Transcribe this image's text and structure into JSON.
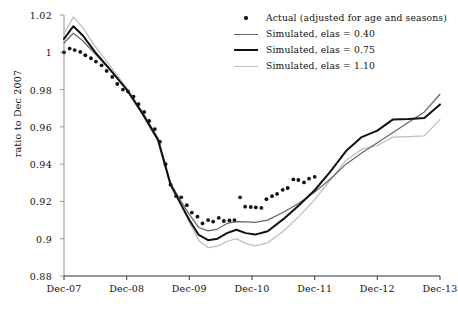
{
  "chart_data": {
    "type": "line",
    "title": "",
    "xlabel": "",
    "ylabel": "ratio to Dec 2007",
    "ylim": [
      0.88,
      1.02
    ],
    "xlim": [
      2007.0,
      2013.0
    ],
    "grid": false,
    "legend_position": "top-right",
    "ytick_labels": [
      "1.02",
      "1",
      "0.98",
      "0.96",
      "0.94",
      "0.92",
      "0.9",
      "0.88"
    ],
    "ytick_values": [
      1.02,
      1.0,
      0.98,
      0.96,
      0.94,
      0.92,
      0.9,
      0.88
    ],
    "xtick_labels": [
      "Dec-07",
      "Dec-08",
      "Dec-09",
      "Dec-10",
      "Dec-11",
      "Dec-12",
      "Dec-13"
    ],
    "xtick_values": [
      2007.0,
      2008.0,
      2009.0,
      2010.0,
      2011.0,
      2012.0,
      2013.0
    ],
    "colors": {
      "actual": "#111111",
      "elas_040": "#666666",
      "elas_075": "#111111",
      "elas_110": "#bdbdbd",
      "axis": "#999999",
      "background": "#ffffff"
    },
    "series": [
      {
        "name": "Actual (adjusted for age and seasons)",
        "type": "scatter",
        "color": "#111111",
        "x": [
          2007.0,
          2007.09,
          2007.17,
          2007.26,
          2007.34,
          2007.43,
          2007.51,
          2007.6,
          2007.68,
          2007.77,
          2007.85,
          2007.94,
          2008.02,
          2008.11,
          2008.19,
          2008.28,
          2008.36,
          2008.45,
          2008.53,
          2008.62,
          2008.7,
          2008.79,
          2008.87,
          2008.96,
          2009.04,
          2009.13,
          2009.21,
          2009.3,
          2009.38,
          2009.47,
          2009.55,
          2009.64,
          2009.72,
          2009.81,
          2009.89,
          2009.98,
          2010.06,
          2010.15,
          2010.23,
          2010.32,
          2010.4,
          2010.49,
          2010.57,
          2010.66,
          2010.74,
          2010.83,
          2010.91,
          2011.0
        ],
        "y": [
          1.0,
          1.002,
          1.0012,
          1.0002,
          0.9984,
          0.9968,
          0.995,
          0.993,
          0.99,
          0.9868,
          0.983,
          0.98,
          0.979,
          0.9762,
          0.9722,
          0.968,
          0.9632,
          0.9588,
          0.952,
          0.94,
          0.929,
          0.9228,
          0.9222,
          0.918,
          0.914,
          0.9118,
          0.9082,
          0.91,
          0.9092,
          0.9112,
          0.9095,
          0.9098,
          0.91,
          0.9222,
          0.9172,
          0.917,
          0.9168,
          0.9165,
          0.9212,
          0.9228,
          0.924,
          0.9262,
          0.9272,
          0.9318,
          0.9315,
          0.9302,
          0.9322,
          0.9332
        ]
      },
      {
        "name": "Simulated, elas = 0.40",
        "type": "line",
        "color": "#666666",
        "x": [
          2007.0,
          2007.15,
          2007.3,
          2007.5,
          2007.75,
          2008.0,
          2008.25,
          2008.5,
          2008.7,
          2008.85,
          2009.0,
          2009.15,
          2009.3,
          2009.45,
          2009.6,
          2009.75,
          2009.9,
          2010.05,
          2010.25,
          2010.5,
          2010.75,
          2011.0,
          2011.25,
          2011.5,
          2011.75,
          2012.0,
          2012.25,
          2012.5,
          2012.75,
          2013.0
        ],
        "y": [
          1.005,
          1.0102,
          1.0062,
          0.999,
          0.99,
          0.98,
          0.968,
          0.954,
          0.93,
          0.921,
          0.913,
          0.906,
          0.9042,
          0.9052,
          0.9082,
          0.9092,
          0.909,
          0.9088,
          0.91,
          0.9142,
          0.919,
          0.925,
          0.932,
          0.94,
          0.946,
          0.9515,
          0.957,
          0.9625,
          0.968,
          0.9775
        ]
      },
      {
        "name": "Simulated, elas = 0.75",
        "type": "line",
        "color": "#111111",
        "x": [
          2007.0,
          2007.15,
          2007.3,
          2007.5,
          2007.75,
          2008.0,
          2008.25,
          2008.5,
          2008.7,
          2008.85,
          2009.0,
          2009.15,
          2009.3,
          2009.45,
          2009.6,
          2009.75,
          2009.9,
          2010.05,
          2010.25,
          2010.5,
          2010.75,
          2011.0,
          2011.25,
          2011.5,
          2011.75,
          2012.0,
          2012.25,
          2012.5,
          2012.75,
          2013.0
        ],
        "y": [
          1.0072,
          1.014,
          1.009,
          1.0,
          0.9902,
          0.98,
          0.9672,
          0.953,
          0.929,
          0.9195,
          0.91,
          0.902,
          0.8992,
          0.9,
          0.903,
          0.9048,
          0.903,
          0.9022,
          0.904,
          0.9105,
          0.918,
          0.926,
          0.936,
          0.947,
          0.9545,
          0.958,
          0.964,
          0.9642,
          0.9648,
          0.972
        ]
      },
      {
        "name": "Simulated, elas = 1.10",
        "type": "line",
        "color": "#bdbdbd",
        "x": [
          2007.0,
          2007.15,
          2007.3,
          2007.5,
          2007.75,
          2008.0,
          2008.25,
          2008.5,
          2008.7,
          2008.85,
          2009.0,
          2009.15,
          2009.3,
          2009.45,
          2009.6,
          2009.75,
          2009.9,
          2010.05,
          2010.25,
          2010.5,
          2010.75,
          2011.0,
          2011.25,
          2011.5,
          2011.75,
          2012.0,
          2012.25,
          2012.5,
          2012.75,
          2013.0
        ],
        "y": [
          1.01,
          1.019,
          1.0132,
          1.003,
          0.992,
          0.981,
          0.968,
          0.953,
          0.929,
          0.919,
          0.909,
          0.899,
          0.8952,
          0.896,
          0.8985,
          0.9,
          0.8975,
          0.8962,
          0.8978,
          0.904,
          0.912,
          0.921,
          0.9315,
          0.942,
          0.948,
          0.95,
          0.9545,
          0.9548,
          0.9552,
          0.964
        ]
      }
    ]
  },
  "legend": {
    "items": [
      {
        "label": "Actual (adjusted for age and seasons)",
        "marker": "dot",
        "color": "#111111",
        "width": 0
      },
      {
        "label": "Simulated, elas = 0.40",
        "marker": "line",
        "color": "#666666",
        "width": 1.3
      },
      {
        "label": "Simulated, elas = 0.75",
        "marker": "line",
        "color": "#111111",
        "width": 2.1
      },
      {
        "label": "Simulated, elas = 1.10",
        "marker": "line",
        "color": "#bdbdbd",
        "width": 1.3
      }
    ]
  }
}
